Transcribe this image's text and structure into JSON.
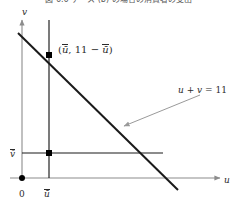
{
  "figure": {
    "caption_top": "図 6.6   ケース (b) の場合の消費者の支出",
    "axes": {
      "x_axis_label": "u",
      "y_axis_label": "v",
      "origin_label": "0"
    },
    "ticks": {
      "x_tick_label": "ū",
      "y_tick_label": "v̄"
    },
    "annotations": {
      "point_label_open": "(",
      "point_label_x": "ū",
      "point_label_sep": ", ",
      "point_label_const": "11",
      "point_label_minus": " − ",
      "point_label_y": "ū",
      "point_label_close": ")",
      "line_equation_lhs_u": "u",
      "line_equation_plus": " + ",
      "line_equation_lhs_v": "v",
      "line_equation_eq": " = ",
      "line_equation_rhs": "11"
    },
    "colors": {
      "line_color": "#1a1a1a",
      "axis_color": "#8c8c8c",
      "guide_color": "#1a1a1a",
      "leader_color": "#9a9a9a",
      "point_color": "#000000",
      "text_color": "#2b2b2b"
    },
    "geometry": {
      "intercept_sum": 11,
      "u_bar": 49,
      "v_bar": 153,
      "origin_x": 22,
      "origin_y": 178,
      "line_start_x": 18,
      "line_start_y": 33,
      "line_end_x": 178,
      "line_end_y": 190,
      "guide_vertical_top": 20,
      "guide_vertical_bottom": 178,
      "guide_horizontal_right": 163,
      "leader_from_x": 200,
      "leader_from_y": 95,
      "leader_to_x": 122,
      "leader_to_y": 127
    }
  }
}
